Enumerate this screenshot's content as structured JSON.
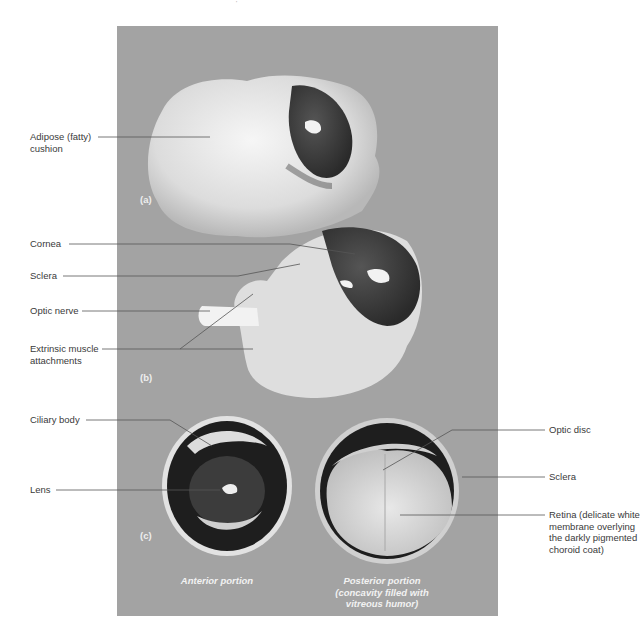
{
  "figure": {
    "top_mark": "'",
    "panels": [
      {
        "id": "a",
        "letter": "(a)",
        "labels": [
          {
            "text_line1": "Adipose (fatty)",
            "text_line2": "cushion"
          }
        ]
      },
      {
        "id": "b",
        "letter": "(b)",
        "labels": [
          {
            "text_line1": "Cornea"
          },
          {
            "text_line1": "Sclera"
          },
          {
            "text_line1": "Optic nerve"
          },
          {
            "text_line1": "Extrinsic muscle",
            "text_line2": "attachments"
          }
        ]
      },
      {
        "id": "c",
        "letter": "(c)",
        "left_labels": [
          {
            "text_line1": "Ciliary body"
          },
          {
            "text_line1": "Lens"
          }
        ],
        "right_labels": [
          {
            "text_line1": "Optic disc"
          },
          {
            "text_line1": "Sclera"
          },
          {
            "text_line1": "Retina (delicate white",
            "text_line2": "membrane overlying",
            "text_line3": "the darkly pigmented",
            "text_line4": "choroid coat)"
          }
        ],
        "captions": {
          "anterior": "Anterior portion",
          "posterior_line1": "Posterior portion",
          "posterior_line2": "(concavity filled with",
          "posterior_line3": "vitreous humor)"
        }
      }
    ]
  },
  "colors": {
    "background": "#ffffff",
    "photo_bg": "#a3a3a3",
    "tissue_white": "#ececec",
    "cornea_dark": "#3c3c3c",
    "label_text": "#3a3a3a",
    "leader_line": "#555555"
  }
}
